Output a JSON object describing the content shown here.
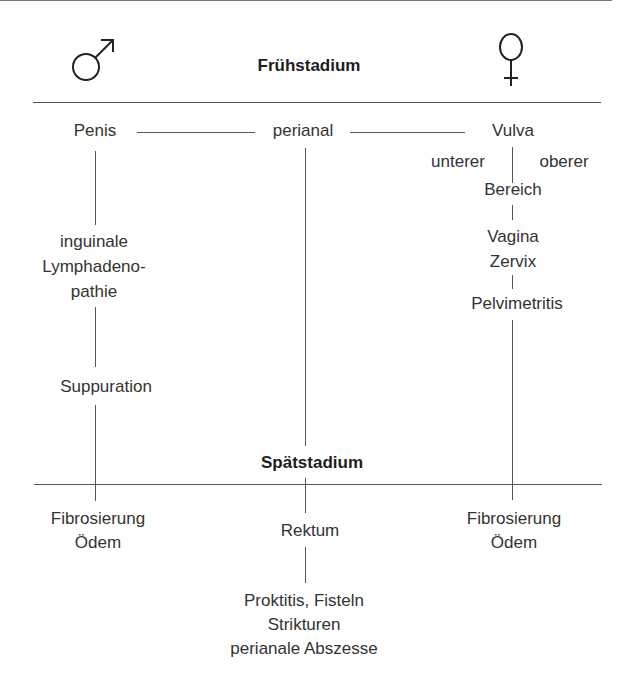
{
  "stages": {
    "early": "Frühstadium",
    "late": "Spätstadium"
  },
  "symbols": {
    "male": "male-symbol",
    "female": "female-symbol"
  },
  "early": {
    "male": {
      "site": "Penis",
      "step1": [
        "inguinale",
        "Lymphadeno-",
        "pathie"
      ],
      "step2": "Suppuration"
    },
    "center": {
      "site": "perianal"
    },
    "female": {
      "site": "Vulva",
      "sub_left": "unterer",
      "sub_right": "oberer",
      "sub_bottom": "Bereich",
      "step1": [
        "Vagina",
        "Zervix"
      ],
      "step2": "Pelvimetritis"
    }
  },
  "late": {
    "male": [
      "Fibrosierung",
      "Ödem"
    ],
    "center": {
      "site": "Rektum",
      "effects": [
        "Proktitis, Fisteln",
        "Strikturen",
        "perianale Abszesse"
      ]
    },
    "female": [
      "Fibrosierung",
      "Ödem"
    ]
  },
  "colors": {
    "line": "#555555",
    "text": "#333333"
  }
}
